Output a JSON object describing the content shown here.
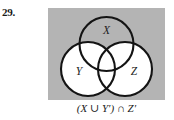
{
  "exercise": {
    "number": "29."
  },
  "diagram": {
    "type": "venn-3-set",
    "caption": "(X ∪ Y′) ∩ Z′",
    "background_color": "#b4b4b4",
    "stroke_color": "#141414",
    "unshaded_color": "#ffffff",
    "sets": [
      {
        "id": "x",
        "label": "X",
        "position": "top",
        "cx": 58.5,
        "cy": 36,
        "r": 27,
        "label_x": 58.5,
        "label_y": 26
      },
      {
        "id": "y",
        "label": "Y",
        "position": "bottom-left",
        "cx": 40,
        "cy": 61,
        "r": 27,
        "label_x": 31,
        "label_y": 67
      },
      {
        "id": "z",
        "label": "Z",
        "position": "bottom-right",
        "cx": 77,
        "cy": 61,
        "r": 27,
        "label_x": 86,
        "label_y": 67
      }
    ],
    "regions": [
      {
        "id": "x-only",
        "name": "X only",
        "shaded": true
      },
      {
        "id": "y-only",
        "name": "Y only",
        "shaded": false
      },
      {
        "id": "z-only",
        "name": "Z only",
        "shaded": false
      },
      {
        "id": "xy",
        "name": "X ∩ Y only",
        "shaded": false
      },
      {
        "id": "xz",
        "name": "X ∩ Z only",
        "shaded": false
      },
      {
        "id": "yz",
        "name": "Y ∩ Z only",
        "shaded": false
      },
      {
        "id": "xyz",
        "name": "X ∩ Y ∩ Z",
        "shaded": false
      },
      {
        "id": "universe",
        "name": "outside all sets",
        "shaded": true
      }
    ]
  }
}
